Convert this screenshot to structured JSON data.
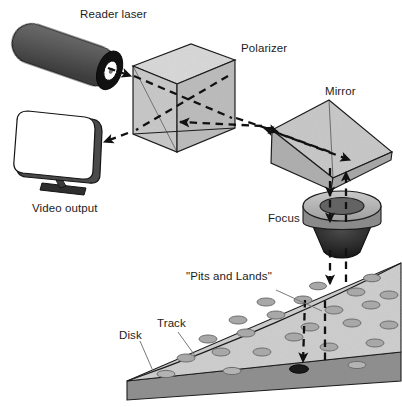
{
  "diagram": {
    "labels": {
      "reader_laser": "Reader laser",
      "polarizer": "Polarizer",
      "mirror": "Mirror",
      "focus": "Focus",
      "video_output": "Video output",
      "pits_and_lands": "\"Pits and Lands\"",
      "track": "Track",
      "disk": "Disk"
    },
    "colors": {
      "laser_body": "#5a5a5a",
      "laser_rim": "#111111",
      "laser_aperture": "#ffffff",
      "prism_face_light": "#d9d9d9",
      "prism_face_mid": "#c4c4c4",
      "prism_face_dark": "#b0b0b0",
      "outline": "#1c1c1c",
      "beam": "#111111",
      "disk_top": "#cfcfcf",
      "disk_substrate": "#8e8e8e",
      "pit_fill": "#a8a8a8",
      "pit_active": "#1a1a1a",
      "screen": "#ffffff",
      "screen_edge": "#4a4a4a",
      "leader": "#7a7a7a",
      "text": "#1c1c1c"
    },
    "components": [
      {
        "name": "reader-laser",
        "shape": "cylinder",
        "note": "dark tilted cylinder with black rim and white emitting aperture"
      },
      {
        "name": "polarizer",
        "shape": "cube-prism",
        "note": "beam-splitter cube with visible internal diagonal faces"
      },
      {
        "name": "mirror",
        "shape": "tilted-prism",
        "note": "angled reflective prism redirecting beam downward"
      },
      {
        "name": "focus-lens",
        "shape": "disc-with-cone",
        "note": "ring lens on dark conical mount"
      },
      {
        "name": "video-output",
        "shape": "monitor",
        "note": "rounded white screen with stand"
      },
      {
        "name": "disk",
        "shape": "wedge-slab",
        "note": "data layer with pits over substrate"
      }
    ],
    "beam_segments": [
      {
        "from": "reader-laser",
        "to": "polarizer",
        "direction": "right-down"
      },
      {
        "from": "polarizer",
        "to": "mirror",
        "direction": "right"
      },
      {
        "from": "mirror",
        "to": "focus-lens",
        "direction": "down"
      },
      {
        "from": "focus-lens",
        "to": "disk-pit",
        "direction": "down"
      },
      {
        "from": "disk-pit",
        "to": "focus-lens",
        "direction": "up"
      },
      {
        "from": "mirror",
        "to": "polarizer",
        "direction": "left"
      },
      {
        "from": "polarizer",
        "to": "video-output",
        "direction": "left-down"
      }
    ],
    "pit_rows": 6,
    "active_pit": {
      "x": 299,
      "y": 369,
      "state": "illuminated"
    }
  }
}
